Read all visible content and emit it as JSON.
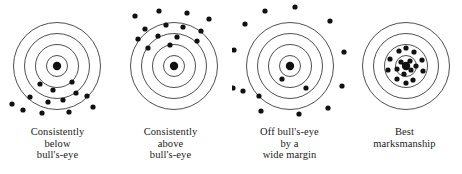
{
  "figure": {
    "background_color": "#ffffff",
    "ring_color": "#3b3b3b",
    "dot_color": "#111111",
    "text_color": "#1a1a1a"
  },
  "targets": [
    {
      "id": "target-consistently-below",
      "center": {
        "x": 57,
        "y": 66
      },
      "ring_radii": [
        10.5,
        21.5,
        32.5,
        43.5
      ],
      "bullseye_radius": 4.2,
      "dot_radius": 2.6,
      "caption_lines": [
        "Consistently",
        "below",
        "bull's-eye"
      ],
      "shot_count": 13,
      "shots": [
        {
          "x": 40,
          "y": 84
        },
        {
          "x": 53,
          "y": 90
        },
        {
          "x": 72,
          "y": 82
        },
        {
          "x": 76,
          "y": 93
        },
        {
          "x": 30,
          "y": 97
        },
        {
          "x": 48,
          "y": 102
        },
        {
          "x": 63,
          "y": 100
        },
        {
          "x": 87,
          "y": 96
        },
        {
          "x": 12,
          "y": 104
        },
        {
          "x": 23,
          "y": 110
        },
        {
          "x": 42,
          "y": 113
        },
        {
          "x": 69,
          "y": 112
        },
        {
          "x": 93,
          "y": 107
        }
      ]
    },
    {
      "id": "target-consistently-above",
      "center": {
        "x": 61,
        "y": 66
      },
      "ring_radii": [
        10.5,
        21.5,
        32.5,
        43.5
      ],
      "bullseye_radius": 4.2,
      "dot_radius": 2.6,
      "caption_lines": [
        "Consistently",
        "above",
        "bull's-eye"
      ],
      "shot_count": 14,
      "shots": [
        {
          "x": 22,
          "y": 16
        },
        {
          "x": 46,
          "y": 11
        },
        {
          "x": 74,
          "y": 13
        },
        {
          "x": 96,
          "y": 19
        },
        {
          "x": 32,
          "y": 29
        },
        {
          "x": 53,
          "y": 25
        },
        {
          "x": 70,
          "y": 27
        },
        {
          "x": 88,
          "y": 31
        },
        {
          "x": 25,
          "y": 39
        },
        {
          "x": 45,
          "y": 36
        },
        {
          "x": 64,
          "y": 37
        },
        {
          "x": 84,
          "y": 41
        },
        {
          "x": 35,
          "y": 48
        },
        {
          "x": 57,
          "y": 45
        }
      ]
    },
    {
      "id": "target-off-bullseye",
      "center": {
        "x": 58,
        "y": 66
      },
      "ring_radii": [
        10.5,
        21.5,
        32.5,
        43.5
      ],
      "bullseye_radius": 4.2,
      "dot_radius": 2.6,
      "caption_lines": [
        "Off bull's-eye",
        "by a",
        "wide margin"
      ],
      "shot_count": 15,
      "shots": [
        {
          "x": 33,
          "y": 11
        },
        {
          "x": 63,
          "y": 7
        },
        {
          "x": 13,
          "y": 24
        },
        {
          "x": 98,
          "y": 21
        },
        {
          "x": 2,
          "y": 50
        },
        {
          "x": 112,
          "y": 52
        },
        {
          "x": 1,
          "y": 88
        },
        {
          "x": 110,
          "y": 86
        },
        {
          "x": 27,
          "y": 96
        },
        {
          "x": 11,
          "y": 91
        },
        {
          "x": 29,
          "y": 111
        },
        {
          "x": 67,
          "y": 114
        },
        {
          "x": 96,
          "y": 108
        },
        {
          "x": 50,
          "y": 79
        },
        {
          "x": 74,
          "y": 88
        }
      ]
    },
    {
      "id": "target-best-marksmanship",
      "center": {
        "x": 59,
        "y": 66
      },
      "ring_radii": [
        10.5,
        21.5,
        32.5,
        43.5
      ],
      "bullseye_radius": 4.2,
      "dot_radius": 2.6,
      "caption_lines": [
        "Best",
        "marksmanship"
      ],
      "shot_count": 17,
      "shots": [
        {
          "x": 52,
          "y": 51
        },
        {
          "x": 67,
          "y": 52
        },
        {
          "x": 43,
          "y": 59
        },
        {
          "x": 75,
          "y": 60
        },
        {
          "x": 41,
          "y": 70
        },
        {
          "x": 76,
          "y": 71
        },
        {
          "x": 50,
          "y": 79
        },
        {
          "x": 66,
          "y": 80
        },
        {
          "x": 59,
          "y": 48
        },
        {
          "x": 59,
          "y": 83
        },
        {
          "x": 54,
          "y": 62
        },
        {
          "x": 63,
          "y": 61
        },
        {
          "x": 50,
          "y": 69
        },
        {
          "x": 64,
          "y": 70
        },
        {
          "x": 58,
          "y": 65
        },
        {
          "x": 57,
          "y": 74
        },
        {
          "x": 69,
          "y": 66
        }
      ]
    }
  ]
}
